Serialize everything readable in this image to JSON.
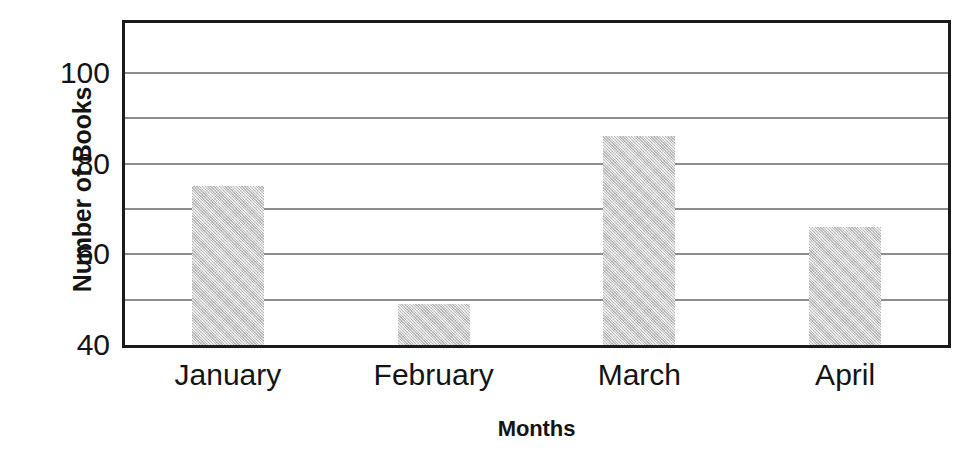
{
  "chart_data": {
    "type": "bar",
    "title": "",
    "xlabel": "Months",
    "ylabel": "Number of Books",
    "categories": [
      "January",
      "February",
      "March",
      "April"
    ],
    "values": [
      75,
      49,
      86,
      66
    ],
    "series": [
      {
        "name": "Number of Books",
        "values": [
          75,
          49,
          86,
          66
        ]
      }
    ],
    "ylim": [
      40,
      111
    ],
    "yticks": [
      40,
      60,
      80,
      100
    ],
    "ytick_labels": [
      "40",
      "60",
      "80",
      "100"
    ],
    "gridlines": [
      50,
      60,
      70,
      80,
      90,
      100
    ],
    "grid": true,
    "grid_axis": "y",
    "legend": false,
    "legend_position": "none",
    "bar_color": "#c9c9c9",
    "axis_color": "#1b1b1b",
    "grid_color": "#8d8d8d",
    "text_color": "#141414"
  }
}
